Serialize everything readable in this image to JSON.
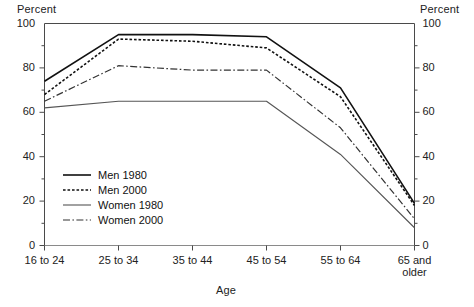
{
  "chart_data": {
    "type": "line",
    "title": "",
    "xlabel": "Age",
    "ylabel": "Percent",
    "ylabel_right": "Percent",
    "categories": [
      "16 to 24",
      "25 to 34",
      "35 to 44",
      "45 to 54",
      "55 to 64",
      "65 and older"
    ],
    "ylim": [
      0,
      100
    ],
    "yticks": [
      0,
      20,
      40,
      60,
      80,
      100
    ],
    "ytick_labels": [
      "0",
      "20",
      "40",
      "60",
      "80",
      "100"
    ],
    "yminor_ticks": [
      10,
      30,
      50,
      70,
      90
    ],
    "grid": false,
    "legend_position": "inside-lower-left",
    "series": [
      {
        "name": "Men 1980",
        "style": "solid",
        "color": "#111111",
        "width": 1.6,
        "values": [
          74,
          95,
          95,
          94,
          71,
          19
        ]
      },
      {
        "name": "Men 2000",
        "style": "dotted",
        "color": "#111111",
        "width": 1.6,
        "values": [
          68,
          93,
          92,
          89,
          67,
          18
        ]
      },
      {
        "name": "Women 1980",
        "style": "solid-thin",
        "color": "#555555",
        "width": 1.1,
        "values": [
          62,
          65,
          65,
          65,
          41,
          8
        ]
      },
      {
        "name": "Women 2000",
        "style": "dash-dot",
        "color": "#333333",
        "width": 1.2,
        "values": [
          65,
          81,
          79,
          79,
          53,
          12
        ]
      }
    ]
  },
  "axes": {
    "left_title": "Percent",
    "right_title": "Percent",
    "x_title": "Age"
  }
}
